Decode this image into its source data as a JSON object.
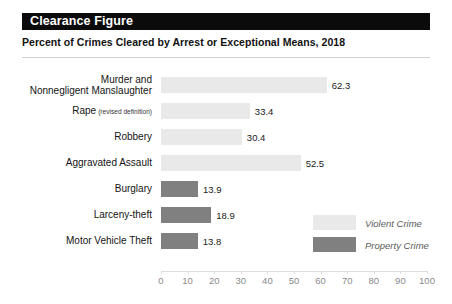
{
  "header": {
    "band_title": "Clearance Figure",
    "subtitle": "Percent of Crimes Cleared by Arrest or Exceptional Means, 2018"
  },
  "legend": {
    "items": [
      {
        "label": "Violent Crime",
        "color": "#e9e9e9",
        "key": "violent"
      },
      {
        "label": "Property Crime",
        "color": "#808080",
        "key": "property"
      }
    ]
  },
  "chart_data": {
    "type": "bar",
    "orientation": "horizontal",
    "title": "Clearance Figure",
    "subtitle": "Percent of Crimes Cleared by Arrest or Exceptional Means, 2018",
    "xlabel": "",
    "ylabel": "",
    "xlim": [
      0,
      100
    ],
    "xticks": [
      "0",
      "10",
      "20",
      "30",
      "40",
      "50",
      "60",
      "70",
      "80",
      "90",
      "100"
    ],
    "grid": false,
    "legend_position": "inside-right",
    "categories": [
      "Murder and Nonnegligent Manslaughter",
      "Rape (revised definition)",
      "Robbery",
      "Aggravated Assault",
      "Burglary",
      "Larceny-theft",
      "Motor Vehicle Theft"
    ],
    "values": [
      62.3,
      33.4,
      30.4,
      52.5,
      13.9,
      18.9,
      13.8
    ],
    "value_labels": [
      "62.3",
      "33.4",
      "30.4",
      "52.5",
      "13.9",
      "18.9",
      "13.8"
    ],
    "groups": [
      "violent",
      "violent",
      "violent",
      "violent",
      "property",
      "property",
      "property"
    ],
    "rows": [
      {
        "label_main": "Murder and",
        "label_second": "Nonnegligent Manslaughter",
        "label_note": "",
        "value": 62.3,
        "value_label": "62.3",
        "group": "violent"
      },
      {
        "label_main": "Rape",
        "label_second": "",
        "label_note": "(revised definition)",
        "value": 33.4,
        "value_label": "33.4",
        "group": "violent"
      },
      {
        "label_main": "Robbery",
        "label_second": "",
        "label_note": "",
        "value": 30.4,
        "value_label": "30.4",
        "group": "violent"
      },
      {
        "label_main": "Aggravated Assault",
        "label_second": "",
        "label_note": "",
        "value": 52.5,
        "value_label": "52.5",
        "group": "violent"
      },
      {
        "label_main": "Burglary",
        "label_second": "",
        "label_note": "",
        "value": 13.9,
        "value_label": "13.9",
        "group": "property"
      },
      {
        "label_main": "Larceny-theft",
        "label_second": "",
        "label_note": "",
        "value": 18.9,
        "value_label": "18.9",
        "group": "property"
      },
      {
        "label_main": "Motor Vehicle Theft",
        "label_second": "",
        "label_note": "",
        "value": 13.8,
        "value_label": "13.8",
        "group": "property"
      }
    ],
    "series": [
      {
        "name": "Violent Crime",
        "color": "#e9e9e9"
      },
      {
        "name": "Property Crime",
        "color": "#808080"
      }
    ]
  }
}
